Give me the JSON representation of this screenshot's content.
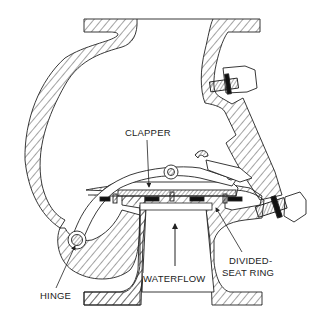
{
  "diagram": {
    "labels": {
      "clapper": "CLAPPER",
      "hinge": "HINGE",
      "waterflow": "WATERFLOW",
      "divided_seat_ring_line1": "DIVIDED-",
      "divided_seat_ring_line2": "SEAT RING"
    },
    "colors": {
      "line": "#222222",
      "background": "#ffffff",
      "hatch": "#333333"
    }
  }
}
